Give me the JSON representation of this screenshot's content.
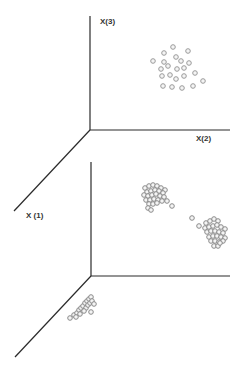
{
  "chart_data": [
    {
      "type": "scatter",
      "title": "",
      "projection": "3d",
      "axes": {
        "x1": {
          "label": "X (1)"
        },
        "x2": {
          "label": "X(2)"
        },
        "x3": {
          "label": "X(3)"
        }
      },
      "grid": false,
      "legend": null,
      "description": "Upper 3D plot: a single diffuse, loosely spread cluster of points in the X(2)-X(3) plane region",
      "series": [
        {
          "name": "diffuse cluster",
          "marker": "open-circle",
          "color": "#9a9a9a",
          "points_px": [
            [
              173,
              47
            ],
            [
              164,
              53
            ],
            [
              188,
              51
            ],
            [
              153,
              61
            ],
            [
              164,
              62
            ],
            [
              176,
              57
            ],
            [
              181,
              61
            ],
            [
              189,
              63
            ],
            [
              168,
              66
            ],
            [
              161,
              69
            ],
            [
              177,
              69
            ],
            [
              184,
              68
            ],
            [
              195,
              73
            ],
            [
              162,
              76
            ],
            [
              170,
              75
            ],
            [
              176,
              79
            ],
            [
              184,
              76
            ],
            [
              203,
              81
            ],
            [
              163,
              86
            ],
            [
              172,
              87
            ],
            [
              182,
              88
            ],
            [
              193,
              86
            ]
          ]
        }
      ]
    },
    {
      "type": "scatter",
      "title": "",
      "projection": "3d",
      "axes": {
        "x1": {
          "label": "X (1)"
        },
        "x2": {
          "label": ""
        },
        "x3": {
          "label": ""
        }
      },
      "grid": false,
      "legend": null,
      "description": "Lower 3D plot: three tight, well separated clusters — two in the X(2)-X(3) plane and one elongated along the X(1) axis",
      "series": [
        {
          "name": "cluster A (upper left)",
          "marker": "open-circle",
          "color": "#8a8a8a",
          "points_px": [
            [
              145,
              188
            ],
            [
              149,
              186
            ],
            [
              153,
              185
            ],
            [
              157,
              186
            ],
            [
              161,
              188
            ],
            [
              165,
              190
            ],
            [
              147,
              192
            ],
            [
              151,
              191
            ],
            [
              155,
              190
            ],
            [
              159,
              191
            ],
            [
              163,
              193
            ],
            [
              144,
              195
            ],
            [
              148,
              196
            ],
            [
              152,
              195
            ],
            [
              156,
              194
            ],
            [
              160,
              196
            ],
            [
              164,
              197
            ],
            [
              146,
              200
            ],
            [
              150,
              200
            ],
            [
              154,
              199
            ],
            [
              158,
              200
            ],
            [
              162,
              201
            ],
            [
              149,
              204
            ],
            [
              153,
              204
            ],
            [
              157,
              203
            ],
            [
              148,
              208
            ],
            [
              151,
              210
            ],
            [
              167,
              201
            ],
            [
              172,
              206
            ]
          ]
        },
        {
          "name": "cluster B (lower right)",
          "marker": "open-circle",
          "color": "#8a8a8a",
          "points_px": [
            [
              192,
              218
            ],
            [
              199,
              226
            ],
            [
              206,
              223
            ],
            [
              210,
              221
            ],
            [
              214,
              219
            ],
            [
              218,
              221
            ],
            [
              205,
              228
            ],
            [
              209,
              227
            ],
            [
              213,
              226
            ],
            [
              217,
              225
            ],
            [
              221,
              227
            ],
            [
              225,
              229
            ],
            [
              207,
              232
            ],
            [
              211,
              231
            ],
            [
              215,
              231
            ],
            [
              219,
              232
            ],
            [
              223,
              233
            ],
            [
              209,
              237
            ],
            [
              213,
              236
            ],
            [
              217,
              236
            ],
            [
              221,
              237
            ],
            [
              225,
              238
            ],
            [
              211,
              241
            ],
            [
              215,
              241
            ],
            [
              219,
              242
            ],
            [
              223,
              241
            ],
            [
              214,
              246
            ],
            [
              218,
              246
            ],
            [
              220,
              243
            ]
          ]
        },
        {
          "name": "cluster C (along X(1) axis)",
          "marker": "open-circle",
          "color": "#8a8a8a",
          "points_px": [
            [
              70,
              318
            ],
            [
              74,
              315
            ],
            [
              77,
              313
            ],
            [
              79,
              310
            ],
            [
              81,
              308
            ],
            [
              83,
              306
            ],
            [
              85,
              303
            ],
            [
              87,
              301
            ],
            [
              89,
              299
            ],
            [
              91,
              297
            ],
            [
              86,
              308
            ],
            [
              88,
              305
            ],
            [
              90,
              303
            ],
            [
              92,
              301
            ],
            [
              80,
              314
            ],
            [
              84,
              311
            ],
            [
              94,
              304
            ],
            [
              91,
              312
            ],
            [
              76,
              317
            ]
          ]
        }
      ]
    }
  ],
  "labels": {
    "x3": "X(3)",
    "x2": "X(2)",
    "x1": "X (1)"
  }
}
